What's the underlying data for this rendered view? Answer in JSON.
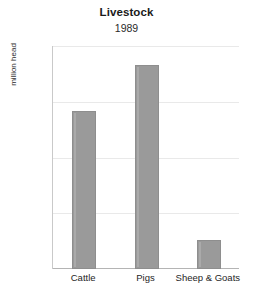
{
  "chart_data": {
    "type": "bar",
    "title": "Livestock",
    "subtitle": "1989",
    "xlabel": "",
    "ylabel": "million head",
    "categories": [
      "Cattle",
      "Pigs",
      "Sheep & Goats"
    ],
    "values": [
      0.85,
      1.1,
      0.155
    ],
    "ylim": [
      0,
      1.2
    ],
    "yticks": [
      0,
      0.3,
      0.6,
      0.9,
      1.2
    ],
    "ytick_labels": [
      "0",
      "0.3",
      "0.6",
      "0.9",
      "1.2"
    ],
    "grid": true,
    "legend": false,
    "legend_position": "none",
    "series": [
      {
        "name": "Livestock 1989",
        "values": [
          0.85,
          1.1,
          0.155
        ]
      }
    ],
    "colors": {
      "bar_fill": "#9a9a9a",
      "bar_stroke": "#8e8e8e",
      "gridline": "#e9e9e9",
      "axis": "#b4b4b4",
      "background": "#ffffff",
      "text": "#262626"
    }
  }
}
